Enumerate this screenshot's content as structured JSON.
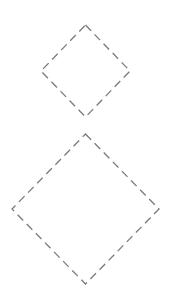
{
  "canvas": {
    "width": 177,
    "height": 301,
    "background": "#ffffff"
  },
  "style": {
    "stroke_color": "#7a7a7a",
    "stroke_dash": "8 5",
    "fill": "none"
  },
  "shapes": [
    {
      "type": "diamond",
      "label": "",
      "points": "85.5,25 130,71 85.5,117 41,71"
    },
    {
      "type": "diamond",
      "label": "",
      "points": "85.5,134 159,209 85.5,284 12,209"
    }
  ]
}
